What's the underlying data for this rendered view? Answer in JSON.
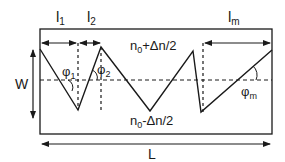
{
  "diagram": {
    "labels": {
      "l1": "l",
      "l1_sub": "1",
      "l2": "l",
      "l2_sub": "2",
      "lm": "l",
      "lm_sub": "m",
      "top_index": "n",
      "top_index_sub": "0",
      "top_index_rest": "+Δn/2",
      "bottom_index": "n",
      "bottom_index_sub": "0",
      "bottom_index_rest": "-Δn/2",
      "phi1": "φ",
      "phi1_sub": "1",
      "phi2": "φ",
      "phi2_sub": "2",
      "phim": "φ",
      "phim_sub": "m",
      "width": "W",
      "length": "L"
    },
    "colors": {
      "stroke": "#1a1a1a",
      "background": "#ffffff"
    }
  }
}
